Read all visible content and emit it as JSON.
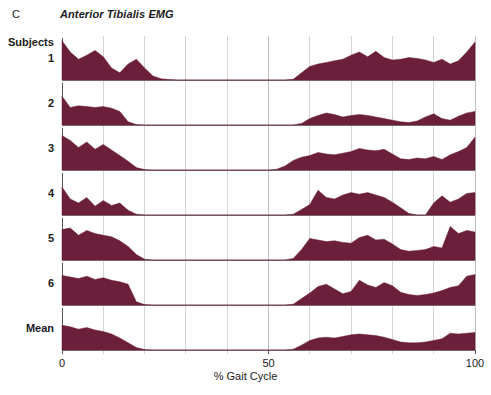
{
  "figure": {
    "panel_letter": "C",
    "title": "Anterior Tibialis EMG",
    "subjects_label": "Subjects"
  },
  "axis": {
    "x_title": "% Gait Cycle",
    "x_ticks": [
      "0",
      "50",
      "100"
    ],
    "x_tick_values": [
      0,
      50,
      100
    ]
  },
  "colors": {
    "trace_fill": "#6B1F3A",
    "gridline": "#b8b8b8",
    "baseline": "#808080",
    "axis": "#555555",
    "background": "#ffffff",
    "text": "#1a1a1a"
  },
  "chart_data": {
    "type": "area",
    "title": "Anterior Tibialis EMG",
    "xlabel": "% Gait Cycle",
    "ylabel": "",
    "xlim": [
      0,
      100
    ],
    "ylim": [
      0,
      1
    ],
    "grid": true,
    "grid_interval": 10,
    "legend_position": "none",
    "panel": "C",
    "row_labels": [
      "1",
      "2",
      "3",
      "4",
      "5",
      "6",
      "Mean"
    ],
    "x": [
      0,
      2,
      4,
      6,
      8,
      10,
      12,
      14,
      16,
      18,
      20,
      22,
      24,
      26,
      28,
      30,
      32,
      34,
      36,
      38,
      40,
      42,
      44,
      46,
      48,
      50,
      52,
      54,
      56,
      58,
      60,
      62,
      64,
      66,
      68,
      70,
      72,
      74,
      76,
      78,
      80,
      82,
      84,
      86,
      88,
      90,
      92,
      94,
      96,
      98,
      100
    ],
    "series": [
      {
        "name": "1",
        "values": [
          0.98,
          0.7,
          0.52,
          0.62,
          0.74,
          0.58,
          0.3,
          0.18,
          0.4,
          0.52,
          0.3,
          0.1,
          0.03,
          0.01,
          0.0,
          0.0,
          0.0,
          0.0,
          0.0,
          0.0,
          0.0,
          0.0,
          0.0,
          0.0,
          0.0,
          0.0,
          0.0,
          0.0,
          0.02,
          0.18,
          0.34,
          0.4,
          0.44,
          0.48,
          0.52,
          0.62,
          0.7,
          0.58,
          0.72,
          0.56,
          0.5,
          0.52,
          0.56,
          0.54,
          0.5,
          0.44,
          0.52,
          0.4,
          0.48,
          0.7,
          0.95
        ]
      },
      {
        "name": "2",
        "values": [
          0.72,
          0.44,
          0.48,
          0.46,
          0.44,
          0.46,
          0.42,
          0.34,
          0.08,
          0.01,
          0.0,
          0.0,
          0.0,
          0.0,
          0.0,
          0.0,
          0.0,
          0.0,
          0.0,
          0.0,
          0.0,
          0.0,
          0.0,
          0.0,
          0.0,
          0.0,
          0.0,
          0.0,
          0.0,
          0.04,
          0.16,
          0.24,
          0.3,
          0.26,
          0.2,
          0.24,
          0.26,
          0.24,
          0.2,
          0.16,
          0.12,
          0.08,
          0.06,
          0.1,
          0.2,
          0.28,
          0.16,
          0.12,
          0.22,
          0.3,
          0.34
        ]
      },
      {
        "name": "3",
        "values": [
          0.86,
          0.74,
          0.56,
          0.7,
          0.52,
          0.64,
          0.5,
          0.36,
          0.22,
          0.06,
          0.01,
          0.0,
          0.0,
          0.0,
          0.0,
          0.0,
          0.0,
          0.0,
          0.0,
          0.0,
          0.0,
          0.0,
          0.0,
          0.0,
          0.0,
          0.0,
          0.02,
          0.1,
          0.24,
          0.32,
          0.36,
          0.44,
          0.4,
          0.38,
          0.42,
          0.46,
          0.54,
          0.5,
          0.48,
          0.52,
          0.4,
          0.28,
          0.26,
          0.3,
          0.28,
          0.34,
          0.26,
          0.38,
          0.46,
          0.56,
          0.82
        ]
      },
      {
        "name": "4",
        "values": [
          0.7,
          0.4,
          0.3,
          0.44,
          0.22,
          0.36,
          0.24,
          0.3,
          0.12,
          0.02,
          0.0,
          0.0,
          0.0,
          0.0,
          0.0,
          0.0,
          0.0,
          0.0,
          0.0,
          0.0,
          0.0,
          0.0,
          0.0,
          0.0,
          0.0,
          0.0,
          0.0,
          0.0,
          0.02,
          0.14,
          0.26,
          0.62,
          0.44,
          0.4,
          0.5,
          0.56,
          0.52,
          0.56,
          0.5,
          0.44,
          0.32,
          0.18,
          0.04,
          0.0,
          0.0,
          0.3,
          0.48,
          0.32,
          0.4,
          0.54,
          0.56
        ]
      },
      {
        "name": "5",
        "values": [
          0.76,
          0.8,
          0.62,
          0.74,
          0.66,
          0.62,
          0.58,
          0.48,
          0.34,
          0.14,
          0.02,
          0.0,
          0.0,
          0.0,
          0.0,
          0.0,
          0.0,
          0.0,
          0.0,
          0.0,
          0.0,
          0.0,
          0.0,
          0.0,
          0.0,
          0.0,
          0.0,
          0.0,
          0.04,
          0.26,
          0.54,
          0.5,
          0.46,
          0.48,
          0.44,
          0.42,
          0.56,
          0.62,
          0.5,
          0.52,
          0.4,
          0.26,
          0.22,
          0.24,
          0.26,
          0.34,
          0.3,
          0.84,
          0.66,
          0.74,
          0.7
        ]
      },
      {
        "name": "6",
        "values": [
          0.74,
          0.7,
          0.66,
          0.72,
          0.64,
          0.68,
          0.62,
          0.58,
          0.52,
          0.08,
          0.01,
          0.0,
          0.0,
          0.0,
          0.0,
          0.0,
          0.0,
          0.0,
          0.0,
          0.0,
          0.0,
          0.0,
          0.0,
          0.0,
          0.0,
          0.0,
          0.0,
          0.0,
          0.02,
          0.16,
          0.3,
          0.46,
          0.52,
          0.4,
          0.28,
          0.34,
          0.62,
          0.5,
          0.44,
          0.56,
          0.48,
          0.32,
          0.26,
          0.24,
          0.26,
          0.3,
          0.36,
          0.44,
          0.48,
          0.72,
          0.76
        ]
      },
      {
        "name": "Mean",
        "values": [
          0.62,
          0.58,
          0.52,
          0.56,
          0.5,
          0.46,
          0.4,
          0.3,
          0.18,
          0.06,
          0.01,
          0.0,
          0.0,
          0.0,
          0.0,
          0.0,
          0.0,
          0.0,
          0.0,
          0.0,
          0.0,
          0.0,
          0.0,
          0.0,
          0.0,
          0.0,
          0.0,
          0.0,
          0.02,
          0.12,
          0.24,
          0.3,
          0.32,
          0.3,
          0.34,
          0.38,
          0.4,
          0.38,
          0.36,
          0.32,
          0.26,
          0.2,
          0.18,
          0.18,
          0.2,
          0.24,
          0.28,
          0.42,
          0.4,
          0.42,
          0.44
        ]
      }
    ]
  }
}
